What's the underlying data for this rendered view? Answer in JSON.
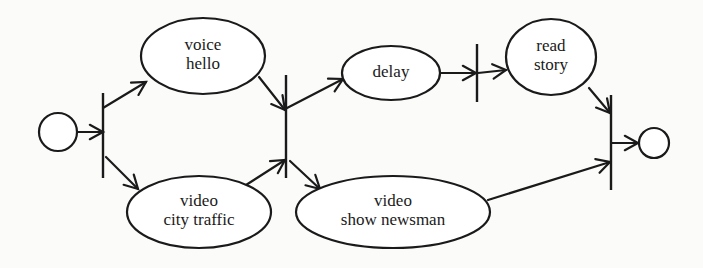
{
  "diagram": {
    "type": "petri-net / activity diagram",
    "colors": {
      "ink": "#1a1a1a",
      "background": "#fbfbfa",
      "node_fill": "#ffffff"
    },
    "start": {
      "id": "start",
      "shape": "circle",
      "cx": 58,
      "cy": 132,
      "r": 19
    },
    "end": {
      "id": "end",
      "shape": "circle",
      "cx": 654,
      "cy": 143,
      "r": 15
    },
    "bars": [
      {
        "id": "fork-1",
        "x": 103,
        "y1": 93,
        "y2": 178
      },
      {
        "id": "join-fork-2",
        "x": 286,
        "y1": 75,
        "y2": 178
      },
      {
        "id": "sync-3",
        "x": 477,
        "y1": 44,
        "y2": 102
      },
      {
        "id": "join-4",
        "x": 611,
        "y1": 95,
        "y2": 190
      }
    ],
    "nodes": [
      {
        "id": "voice-hello",
        "lines": [
          "voice",
          "hello"
        ],
        "cx": 203,
        "cy": 56,
        "rx": 62,
        "ry": 38
      },
      {
        "id": "video-city-traffic",
        "lines": [
          "video",
          "city traffic"
        ],
        "cx": 199,
        "cy": 212,
        "rx": 72,
        "ry": 36
      },
      {
        "id": "delay",
        "lines": [
          "delay"
        ],
        "cx": 391,
        "cy": 73,
        "rx": 49,
        "ry": 27
      },
      {
        "id": "read-story",
        "lines": [
          "read",
          "story"
        ],
        "cx": 551,
        "cy": 57,
        "rx": 45,
        "ry": 38
      },
      {
        "id": "video-show-newsman",
        "lines": [
          "video",
          "show newsman"
        ],
        "cx": 393,
        "cy": 212,
        "rx": 97,
        "ry": 36
      }
    ],
    "edges": [
      {
        "from": "start",
        "to": "fork-1",
        "x1": 77,
        "y1": 132,
        "x2": 103,
        "y2": 132,
        "arrow": true
      },
      {
        "from": "fork-1",
        "to": "voice-hello",
        "x1": 103,
        "y1": 108,
        "x2": 146,
        "y2": 82,
        "arrow": true
      },
      {
        "from": "fork-1",
        "to": "video-city-traffic",
        "x1": 106,
        "y1": 157,
        "x2": 138,
        "y2": 189,
        "arrow": true
      },
      {
        "from": "voice-hello",
        "to": "join-fork-2",
        "x1": 259,
        "y1": 77,
        "x2": 285,
        "y2": 110,
        "arrow": true
      },
      {
        "from": "video-city-traffic",
        "to": "join-fork-2",
        "x1": 246,
        "y1": 185,
        "x2": 285,
        "y2": 160,
        "arrow": true
      },
      {
        "from": "join-fork-2",
        "to": "delay",
        "x1": 287,
        "y1": 108,
        "x2": 343,
        "y2": 79,
        "arrow": true
      },
      {
        "from": "join-fork-2",
        "to": "video-show-newsman",
        "x1": 290,
        "y1": 161,
        "x2": 320,
        "y2": 189,
        "arrow": true
      },
      {
        "from": "delay",
        "to": "sync-3",
        "x1": 440,
        "y1": 73,
        "x2": 476,
        "y2": 73,
        "arrow": true
      },
      {
        "from": "sync-3",
        "to": "read-story",
        "x1": 478,
        "y1": 73,
        "x2": 506,
        "y2": 70,
        "arrow": true
      },
      {
        "from": "read-story",
        "to": "join-4",
        "x1": 589,
        "y1": 88,
        "x2": 610,
        "y2": 113,
        "arrow": true
      },
      {
        "from": "video-show-newsman",
        "to": "join-4",
        "x1": 488,
        "y1": 200,
        "x2": 610,
        "y2": 162,
        "arrow": true
      },
      {
        "from": "join-4",
        "to": "end",
        "x1": 612,
        "y1": 143,
        "x2": 638,
        "y2": 143,
        "arrow": true
      }
    ]
  }
}
